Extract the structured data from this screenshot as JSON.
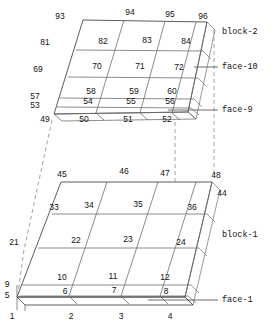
{
  "diagram": {
    "blocks": [
      {
        "name": "block-2",
        "label": "block-2",
        "label_pos": {
          "x": 225,
          "y": 32
        },
        "top_face_nodes": [
          {
            "id": "93",
            "x": 60,
            "y": 17
          },
          {
            "id": "94",
            "x": 130,
            "y": 13
          },
          {
            "id": "95",
            "x": 170,
            "y": 15
          },
          {
            "id": "96",
            "x": 203,
            "y": 17
          }
        ],
        "left_edge_nodes": [
          {
            "id": "81",
            "x": 45,
            "y": 43
          },
          {
            "id": "69",
            "x": 38,
            "y": 70
          },
          {
            "id": "57",
            "x": 35,
            "y": 97
          },
          {
            "id": "53",
            "x": 35,
            "y": 106
          },
          {
            "id": "49",
            "x": 45,
            "y": 120
          }
        ],
        "bottom_row_nodes": [
          {
            "id": "50",
            "x": 84,
            "y": 120
          },
          {
            "id": "51",
            "x": 128,
            "y": 120
          },
          {
            "id": "52",
            "x": 167,
            "y": 120
          }
        ],
        "element_labels": [
          {
            "id": "82",
            "x": 103,
            "y": 42
          },
          {
            "id": "83",
            "x": 147,
            "y": 41
          },
          {
            "id": "84",
            "x": 186,
            "y": 42
          },
          {
            "id": "70",
            "x": 97,
            "y": 67
          },
          {
            "id": "71",
            "x": 140,
            "y": 67
          },
          {
            "id": "72",
            "x": 179,
            "y": 68
          },
          {
            "id": "58",
            "x": 91,
            "y": 92
          },
          {
            "id": "59",
            "x": 134,
            "y": 92
          },
          {
            "id": "60",
            "x": 172,
            "y": 92
          },
          {
            "id": "54",
            "x": 88,
            "y": 102
          },
          {
            "id": "55",
            "x": 131,
            "y": 102
          },
          {
            "id": "56",
            "x": 170,
            "y": 102
          }
        ],
        "faces": [
          {
            "label": "face-10",
            "x": 224,
            "y": 67
          },
          {
            "label": "face-9",
            "x": 224,
            "y": 110
          }
        ]
      },
      {
        "name": "block-1",
        "label": "block-1",
        "label_pos": {
          "x": 225,
          "y": 235
        },
        "top_face_nodes": [
          {
            "id": "45",
            "x": 62,
            "y": 175
          },
          {
            "id": "46",
            "x": 124,
            "y": 172
          },
          {
            "id": "47",
            "x": 165,
            "y": 174
          },
          {
            "id": "48",
            "x": 214,
            "y": 176
          }
        ],
        "left_edge_nodes": [
          {
            "id": "21",
            "x": 14,
            "y": 243
          },
          {
            "id": "9",
            "x": 6,
            "y": 285
          },
          {
            "id": "5",
            "x": 6,
            "y": 296
          },
          {
            "id": "1",
            "x": 10,
            "y": 316
          }
        ],
        "bottom_row_nodes": [
          {
            "id": "2",
            "x": 71,
            "y": 316
          },
          {
            "id": "3",
            "x": 121,
            "y": 316
          },
          {
            "id": "4",
            "x": 170,
            "y": 316
          }
        ],
        "right_nodes": [
          {
            "id": "44",
            "x": 221,
            "y": 194
          }
        ],
        "element_labels": [
          {
            "id": "33",
            "x": 54,
            "y": 208
          },
          {
            "id": "34",
            "x": 89,
            "y": 206
          },
          {
            "id": "35",
            "x": 138,
            "y": 205
          },
          {
            "id": "36",
            "x": 192,
            "y": 208
          },
          {
            "id": "22",
            "x": 76,
            "y": 241
          },
          {
            "id": "23",
            "x": 128,
            "y": 240
          },
          {
            "id": "24",
            "x": 181,
            "y": 243
          },
          {
            "id": "10",
            "x": 62,
            "y": 278
          },
          {
            "id": "11",
            "x": 113,
            "y": 277
          },
          {
            "id": "12",
            "x": 165,
            "y": 278
          },
          {
            "id": "6",
            "x": 65,
            "y": 292
          },
          {
            "id": "7",
            "x": 114,
            "y": 291
          },
          {
            "id": "8",
            "x": 166,
            "y": 292
          }
        ],
        "faces": [
          {
            "label": "face-1",
            "x": 224,
            "y": 300
          }
        ]
      }
    ],
    "colors": {
      "mesh_line": "#6e6e6e",
      "dark_line": "#4a4a4a",
      "dashed_line": "#8a8a8a",
      "text": "#111111",
      "background": "#ffffff"
    }
  }
}
